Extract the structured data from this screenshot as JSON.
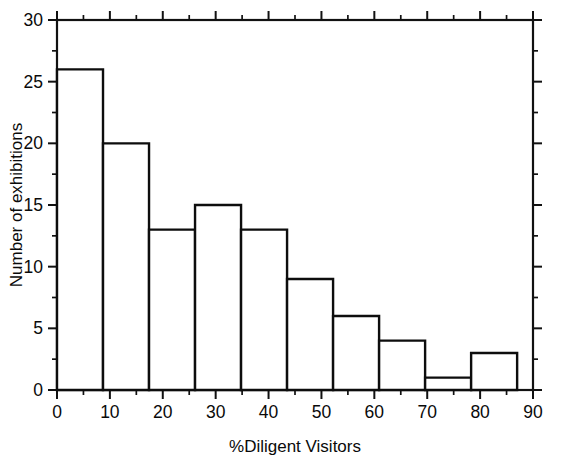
{
  "chart_data": {
    "type": "bar",
    "title": "",
    "subtitle": "",
    "xlabel": "%Diligent Visitors",
    "ylabel": "Number of exhibitions",
    "xlim": [
      0,
      90
    ],
    "ylim": [
      0,
      30
    ],
    "grid": false,
    "legend": null,
    "legend_position": "none",
    "bin_width": 8.7,
    "bin_edges": [
      0,
      8.7,
      17.4,
      26.1,
      34.8,
      43.5,
      52.2,
      60.9,
      69.6,
      78.3,
      87.0
    ],
    "categories": [
      "0-8.7",
      "8.7-17.4",
      "17.4-26.1",
      "26.1-34.8",
      "34.8-43.5",
      "43.5-52.2",
      "52.2-60.9",
      "60.9-69.6",
      "69.6-78.3",
      "78.3-87.0"
    ],
    "values": [
      26,
      20,
      13,
      15,
      13,
      9,
      6,
      4,
      1,
      3
    ],
    "x_ticks_major": [
      0,
      10,
      20,
      30,
      40,
      50,
      60,
      70,
      80,
      90
    ],
    "x_tick_labels": [
      "0",
      "10",
      "20",
      "30",
      "40",
      "50",
      "60",
      "70",
      "80",
      "90"
    ],
    "x_ticks_minor": [
      5,
      15,
      25,
      35,
      45,
      55,
      65,
      75,
      85
    ],
    "y_ticks_major": [
      0,
      5,
      10,
      15,
      20,
      25,
      30
    ],
    "y_tick_labels": [
      "0",
      "5",
      "10",
      "15",
      "20",
      "25",
      "30"
    ],
    "y_ticks_minor": [
      2.5,
      7.5,
      12.5,
      17.5,
      22.5,
      27.5
    ],
    "colors": {
      "bar_fill": "#ffffff",
      "bar_stroke": "#0d0d0d",
      "axis": "#111111",
      "text": "#0a0a0a",
      "background": "#ffffff"
    }
  }
}
